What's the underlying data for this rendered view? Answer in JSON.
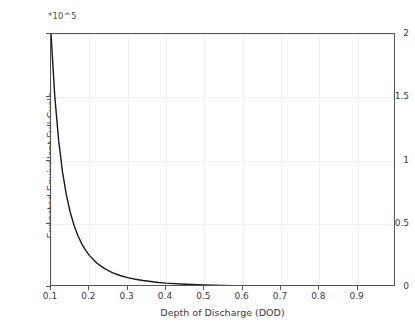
{
  "chart_data": {
    "type": "line",
    "title": "",
    "xlabel": "Depth of Discharge (DOD)",
    "ylabel": "Expected Equivalent Full Cycle",
    "y_exponent_label": "*10^5",
    "y_scale_factor": 100000,
    "xlim": [
      0.1,
      1.0
    ],
    "ylim": [
      0,
      2
    ],
    "grid": true,
    "legend": null,
    "xticks": [
      0.1,
      0.2,
      0.3,
      0.4,
      0.5,
      0.6,
      0.7,
      0.8,
      0.9
    ],
    "xticklabels": [
      "0.1",
      "0.2",
      "0.3",
      "0.4",
      "0.5",
      "0.6",
      "0.7",
      "0.8",
      "0.9"
    ],
    "yticks": [
      0,
      0.5,
      1,
      1.5,
      2
    ],
    "yticklabels": [
      "0",
      "0.5",
      "1",
      "1.5",
      "2"
    ],
    "line_color": "#1a1a1a",
    "line_width": 1.4,
    "series": [
      {
        "name": "Expected Equivalent Full Cycle",
        "x": [
          0.1,
          0.11,
          0.12,
          0.13,
          0.14,
          0.15,
          0.16,
          0.17,
          0.18,
          0.19,
          0.2,
          0.22,
          0.24,
          0.26,
          0.28,
          0.3,
          0.32,
          0.34,
          0.36,
          0.38,
          0.4,
          0.45,
          0.5,
          0.55,
          0.6,
          0.65,
          0.7,
          0.75,
          0.8,
          0.85,
          0.9,
          0.95,
          1.0
        ],
        "y": [
          2.0,
          1.503,
          1.157,
          0.91,
          0.729,
          0.593,
          0.488,
          0.407,
          0.343,
          0.291,
          0.25,
          0.188,
          0.145,
          0.114,
          0.091,
          0.074,
          0.061,
          0.051,
          0.043,
          0.036,
          0.031,
          0.022,
          0.016,
          0.012,
          0.009,
          0.007,
          0.006,
          0.005,
          0.004,
          0.003,
          0.003,
          0.002,
          0.002
        ]
      }
    ]
  }
}
